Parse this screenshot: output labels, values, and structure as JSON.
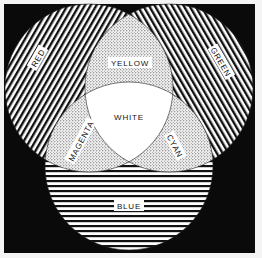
{
  "diagram": {
    "type": "venn-3-set",
    "background_color": "#0a0a0a",
    "circles": [
      {
        "id": "red",
        "label": "RED",
        "pattern": "diagonal-lines-right",
        "cx": 89,
        "cy": 88,
        "r": 84
      },
      {
        "id": "green",
        "label": "GREEN",
        "pattern": "diagonal-lines-left",
        "cx": 169,
        "cy": 88,
        "r": 84
      },
      {
        "id": "blue",
        "label": "BLUE",
        "pattern": "horizontal-lines",
        "cx": 129,
        "cy": 166,
        "r": 84
      }
    ],
    "intersections": [
      {
        "id": "yellow",
        "label": "YELLOW",
        "sets": [
          "red",
          "green"
        ],
        "pattern": "stipple"
      },
      {
        "id": "magenta",
        "label": "MAGENTA",
        "sets": [
          "red",
          "blue"
        ],
        "pattern": "stipple"
      },
      {
        "id": "cyan",
        "label": "CYAN",
        "sets": [
          "green",
          "blue"
        ],
        "pattern": "stipple"
      },
      {
        "id": "white",
        "label": "WHITE",
        "sets": [
          "red",
          "green",
          "blue"
        ],
        "pattern": "solid-white"
      }
    ]
  }
}
